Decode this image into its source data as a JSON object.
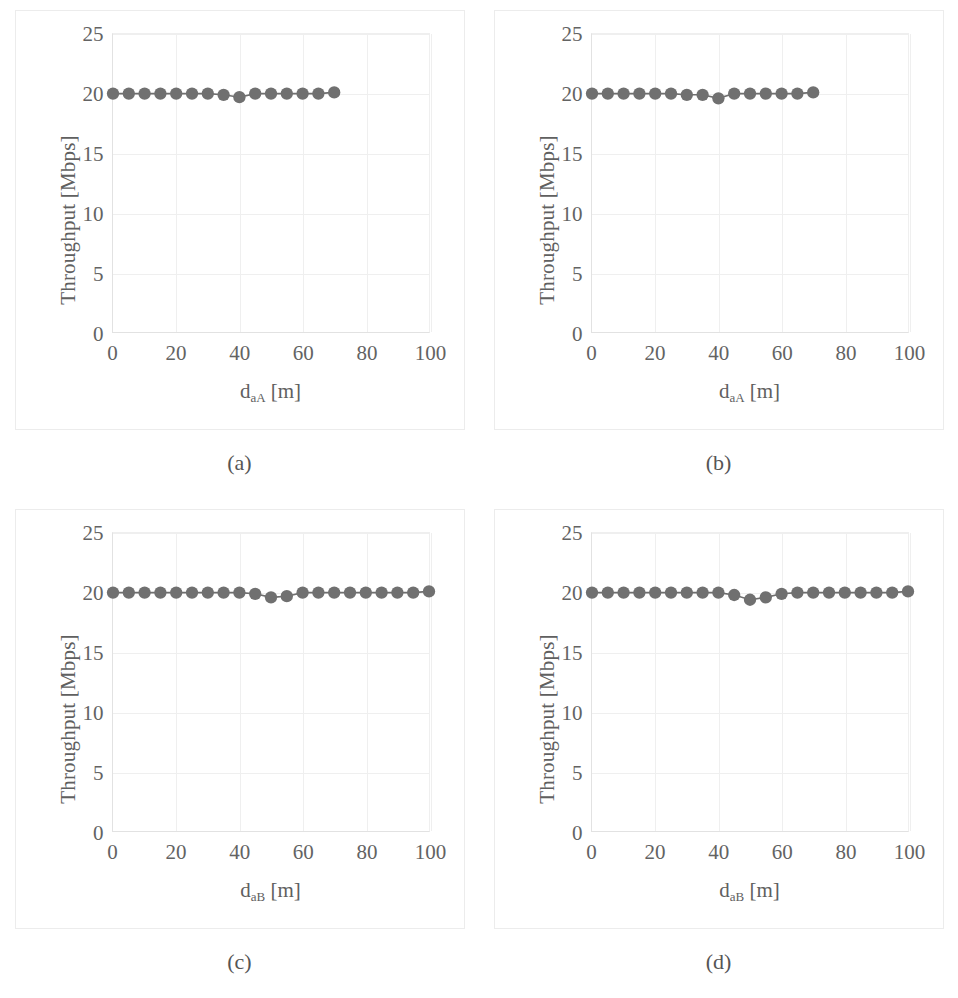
{
  "figure": {
    "panel_border_color": "#ececec",
    "axis_color": "#e2e2e2",
    "grid_color": "#efefef",
    "marker_color": "#707070",
    "line_color": "#6e6e6e",
    "text_color": "#606060"
  },
  "panels": [
    {
      "caption": "(a)",
      "ylabel": "Throughput [Mbps]",
      "xlabel_base": "d",
      "xlabel_sub": "aA",
      "xlabel_unit": " [m]"
    },
    {
      "caption": "(b)",
      "ylabel": "Throughput [Mbps]",
      "xlabel_base": "d",
      "xlabel_sub": "aA",
      "xlabel_unit": " [m]"
    },
    {
      "caption": "(c)",
      "ylabel": "Throughput [Mbps]",
      "xlabel_base": "d",
      "xlabel_sub": "aB",
      "xlabel_unit": " [m]"
    },
    {
      "caption": "(d)",
      "ylabel": "Throughput [Mbps]",
      "xlabel_base": "d",
      "xlabel_sub": "aB",
      "xlabel_unit": " [m]"
    }
  ],
  "chart_data": [
    {
      "type": "line",
      "panel": "(a)",
      "title": "",
      "xlabel": "d_aA [m]",
      "ylabel": "Throughput [Mbps]",
      "xlim": [
        0,
        100
      ],
      "ylim": [
        0,
        25
      ],
      "xticks": [
        0,
        20,
        40,
        60,
        80,
        100
      ],
      "yticks": [
        0,
        5,
        10,
        15,
        20,
        25
      ],
      "grid": true,
      "legend": "none",
      "marker": "circle",
      "x": [
        0,
        5,
        10,
        15,
        20,
        25,
        30,
        35,
        40,
        45,
        50,
        55,
        60,
        65,
        70
      ],
      "y": [
        20.0,
        20.0,
        20.0,
        20.0,
        20.0,
        20.0,
        20.0,
        19.9,
        19.7,
        20.0,
        20.0,
        20.0,
        20.0,
        20.0,
        20.1
      ]
    },
    {
      "type": "line",
      "panel": "(b)",
      "title": "",
      "xlabel": "d_aA [m]",
      "ylabel": "Throughput [Mbps]",
      "xlim": [
        0,
        100
      ],
      "ylim": [
        0,
        25
      ],
      "xticks": [
        0,
        20,
        40,
        60,
        80,
        100
      ],
      "yticks": [
        0,
        5,
        10,
        15,
        20,
        25
      ],
      "grid": true,
      "legend": "none",
      "marker": "circle",
      "x": [
        0,
        5,
        10,
        15,
        20,
        25,
        30,
        35,
        40,
        45,
        50,
        55,
        60,
        65,
        70
      ],
      "y": [
        20.0,
        20.0,
        20.0,
        20.0,
        20.0,
        20.0,
        19.9,
        19.9,
        19.6,
        20.0,
        20.0,
        20.0,
        20.0,
        20.0,
        20.1
      ]
    },
    {
      "type": "line",
      "panel": "(c)",
      "title": "",
      "xlabel": "d_aB [m]",
      "ylabel": "Throughput [Mbps]",
      "xlim": [
        0,
        100
      ],
      "ylim": [
        0,
        25
      ],
      "xticks": [
        0,
        20,
        40,
        60,
        80,
        100
      ],
      "yticks": [
        0,
        5,
        10,
        15,
        20,
        25
      ],
      "grid": true,
      "legend": "none",
      "marker": "circle",
      "x": [
        0,
        5,
        10,
        15,
        20,
        25,
        30,
        35,
        40,
        45,
        50,
        55,
        60,
        65,
        70,
        75,
        80,
        85,
        90,
        95,
        100
      ],
      "y": [
        20.0,
        20.0,
        20.0,
        20.0,
        20.0,
        20.0,
        20.0,
        20.0,
        20.0,
        19.9,
        19.6,
        19.7,
        20.0,
        20.0,
        20.0,
        20.0,
        20.0,
        20.0,
        20.0,
        20.0,
        20.1
      ]
    },
    {
      "type": "line",
      "panel": "(d)",
      "title": "",
      "xlabel": "d_aB [m]",
      "ylabel": "Throughput [Mbps]",
      "xlim": [
        0,
        100
      ],
      "ylim": [
        0,
        25
      ],
      "xticks": [
        0,
        20,
        40,
        60,
        80,
        100
      ],
      "yticks": [
        0,
        5,
        10,
        15,
        20,
        25
      ],
      "grid": true,
      "legend": "none",
      "marker": "circle",
      "x": [
        0,
        5,
        10,
        15,
        20,
        25,
        30,
        35,
        40,
        45,
        50,
        55,
        60,
        65,
        70,
        75,
        80,
        85,
        90,
        95,
        100
      ],
      "y": [
        20.0,
        20.0,
        20.0,
        20.0,
        20.0,
        20.0,
        20.0,
        20.0,
        20.0,
        19.8,
        19.4,
        19.6,
        19.9,
        20.0,
        20.0,
        20.0,
        20.0,
        20.0,
        20.0,
        20.0,
        20.1
      ]
    }
  ]
}
